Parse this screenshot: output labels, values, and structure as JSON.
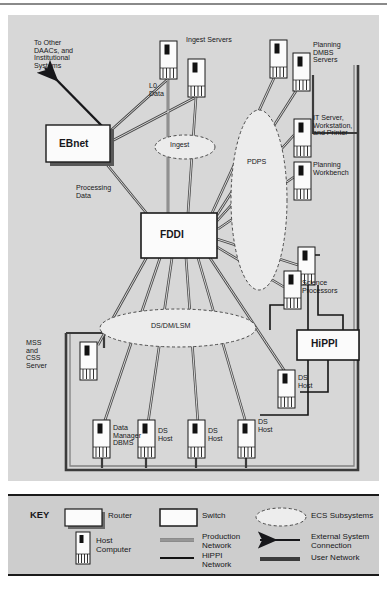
{
  "figure": {
    "type": "network-topology-diagram",
    "background_color": "#d7d7d7",
    "key_background_color": "#cdcdcd",
    "ink_color": "#17171a"
  },
  "diagram": {
    "central_switches": [
      {
        "id": "fddi",
        "label": "FDDI",
        "shape": "switch",
        "x": 133,
        "y": 198,
        "w": 76,
        "h": 45
      },
      {
        "id": "hippi",
        "label": "HiPPI",
        "shape": "switch",
        "x": 289,
        "y": 315,
        "w": 62,
        "h": 30
      }
    ],
    "routers": [
      {
        "id": "ebnet",
        "label": "EBnet",
        "shape": "router",
        "x": 38,
        "y": 110,
        "w": 64,
        "h": 37
      }
    ],
    "hosts": [
      {
        "id": "ingest-server-1",
        "x": 152,
        "y": 26,
        "label": ""
      },
      {
        "id": "ingest-server-2",
        "x": 180,
        "y": 44,
        "label": ""
      },
      {
        "id": "planning-dbms-1",
        "x": 262,
        "y": 25,
        "label": ""
      },
      {
        "id": "planning-dbms-2",
        "x": 285,
        "y": 38,
        "label": ""
      },
      {
        "id": "it-server",
        "x": 286,
        "y": 104,
        "label": ""
      },
      {
        "id": "planning-wb",
        "x": 286,
        "y": 147,
        "label": ""
      },
      {
        "id": "science-proc-1",
        "x": 290,
        "y": 232,
        "label": ""
      },
      {
        "id": "science-proc-2",
        "x": 276,
        "y": 256,
        "label": ""
      },
      {
        "id": "mss-css-server",
        "x": 72,
        "y": 327,
        "label": ""
      },
      {
        "id": "ds-host-right",
        "x": 270,
        "y": 355,
        "label": ""
      },
      {
        "id": "data-manager",
        "x": 85,
        "y": 405,
        "label": ""
      },
      {
        "id": "ds-host-1",
        "x": 130,
        "y": 405,
        "label": ""
      },
      {
        "id": "ds-host-2",
        "x": 180,
        "y": 405,
        "label": ""
      },
      {
        "id": "ds-host-3",
        "x": 230,
        "y": 405,
        "label": ""
      }
    ],
    "subsystem_ovals": [
      {
        "id": "ingest-oval",
        "label": "Ingest",
        "cx": 177,
        "cy": 132,
        "rx": 30,
        "ry": 12
      },
      {
        "id": "pdps-oval",
        "label": "PDPS",
        "cx": 251,
        "cy": 185,
        "rx": 28,
        "ry": 90
      },
      {
        "id": "dsdmlsm-oval",
        "label": "DS/DM/LSM",
        "cx": 170,
        "cy": 313,
        "rx": 78,
        "ry": 19
      }
    ],
    "labels": [
      {
        "id": "to-other-daacs",
        "text": "To Other\nDAACs, and\nInstitutional\nSystems",
        "x": 26,
        "y": 26
      },
      {
        "id": "ingest-servers",
        "text": "Ingest Servers",
        "x": 208,
        "y": 38
      },
      {
        "id": "l0-data",
        "text": "L0\nData",
        "x": 140,
        "y": 73
      },
      {
        "id": "planning-dbms",
        "text": "Planning\nDMBS\nServers",
        "x": 310,
        "y": 38
      },
      {
        "id": "it-server",
        "text": "IT Server,\nWorkstation,\nand Printer",
        "x": 310,
        "y": 107
      },
      {
        "id": "planning-wb",
        "text": "Planning\nWorkbench",
        "x": 310,
        "y": 152
      },
      {
        "id": "processing-data",
        "text": "Processing\nData",
        "x": 72,
        "y": 186
      },
      {
        "id": "science-proc",
        "text": "Science\nProcessors",
        "x": 295,
        "y": 268
      },
      {
        "id": "mss-css",
        "text": "MSS\nand\nCSS\nServer",
        "x": 20,
        "y": 330
      },
      {
        "id": "ds-host-right",
        "text": "DS\nHost",
        "x": 291,
        "y": 361
      },
      {
        "id": "data-manager",
        "text": "Data\nManager\nDBMS",
        "x": 106,
        "y": 410
      },
      {
        "id": "ds-host-1",
        "text": "DS\nHost",
        "x": 151,
        "y": 413
      },
      {
        "id": "ds-host-2",
        "text": "DS\nHost",
        "x": 201,
        "y": 413
      },
      {
        "id": "ds-host-3",
        "text": "DS\nHost",
        "x": 251,
        "y": 408
      }
    ]
  },
  "key": {
    "title": "KEY",
    "entries": [
      {
        "id": "router",
        "label": "Router",
        "glyph": "router-box"
      },
      {
        "id": "host-computer",
        "label": "Host\nComputer",
        "glyph": "host-computer"
      },
      {
        "id": "switch",
        "label": "Switch",
        "glyph": "switch-box"
      },
      {
        "id": "production-network",
        "label": "Production\nNetwork",
        "glyph": "double-line"
      },
      {
        "id": "hippi-network",
        "label": "HiPPI\nNetwork",
        "glyph": "solid-line"
      },
      {
        "id": "ecs-subsystems",
        "label": "ECS Subsystems",
        "glyph": "dashed-oval"
      },
      {
        "id": "external-connection",
        "label": "External System\nConnection",
        "glyph": "arrow-left"
      },
      {
        "id": "user-network",
        "label": "User Network",
        "glyph": "thick-line"
      }
    ]
  }
}
